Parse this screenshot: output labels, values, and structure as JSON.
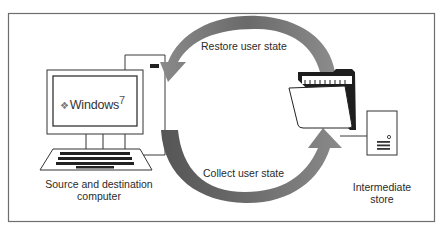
{
  "diagram": {
    "nodes": {
      "computer": {
        "label_line1": "Source and destination",
        "label_line2": "computer",
        "screen_logo_text": "Windows",
        "screen_logo_version": "7",
        "icon": "desktop-computer-icon"
      },
      "store": {
        "label_line1": "Intermediate",
        "label_line2": "store",
        "icon": "server-tower-icon",
        "folder_icon": "open-folder-icon"
      }
    },
    "arrows": {
      "restore": {
        "label": "Restore user state",
        "direction": "store-to-computer"
      },
      "collect": {
        "label": "Collect user state",
        "direction": "computer-to-store"
      }
    },
    "colors": {
      "frame": "#6e6e6e",
      "arrow_fill": "#7a7a7a",
      "arrow_dark": "#555555",
      "line": "#3a3a3a"
    }
  }
}
